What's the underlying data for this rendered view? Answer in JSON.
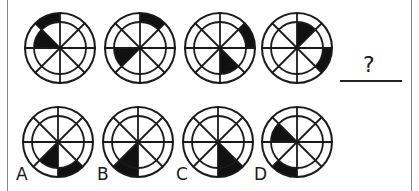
{
  "puzzle": {
    "description": "Figure reasoning: sequence of circles with 8 sectors and inner/outer rings; choose the next figure",
    "sector_index_note": "0=N-NE,1=NE-E,2=E-SE,3=SE-S,4=S-SW,5=SW-W,6=W-NW,7=NW-N (clockwise from top)",
    "question_mark": "?",
    "sequence": [
      {
        "inner_filled": [
          6
        ],
        "outer_filled": [
          7
        ]
      },
      {
        "inner_filled": [
          5
        ],
        "outer_filled": [
          0
        ]
      },
      {
        "inner_filled": [
          3
        ],
        "outer_filled": [
          1
        ]
      },
      {
        "inner_filled": [
          0
        ],
        "outer_filled": [
          2
        ]
      }
    ],
    "options": [
      {
        "label": "A",
        "inner_filled": [
          4
        ],
        "outer_filled": [
          3
        ]
      },
      {
        "label": "B",
        "inner_filled": [
          4
        ],
        "outer_filled": [
          4
        ]
      },
      {
        "label": "C",
        "inner_filled": [
          3
        ],
        "outer_filled": [
          3
        ]
      },
      {
        "label": "D",
        "inner_filled": [
          6
        ],
        "outer_filled": [
          4
        ]
      }
    ]
  },
  "colors": {
    "stroke": "#1a1a1a",
    "fill": "#111111",
    "background": "#ffffff",
    "frame": "#8a8a8a"
  }
}
